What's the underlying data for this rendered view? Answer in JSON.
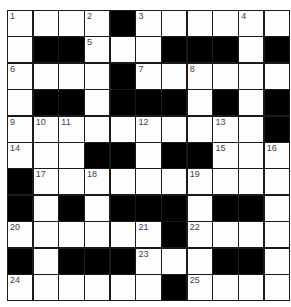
{
  "puzzle": {
    "rows": 11,
    "cols": 11,
    "colors": {
      "block": "#000000",
      "cell": "#fdfdfd",
      "line": "#1a1a1a",
      "number": "#444444"
    },
    "grid": [
      "....#.....X",
      ".##...###.#",
      "....#......",
      ".##.###.#.#",
      "..........#",
      "...##.##...",
      "#..........",
      "#.#.###.##.",
      "......#....",
      "#.###...##.",
      "......#...."
    ],
    "numbers": [
      {
        "r": 0,
        "c": 0,
        "n": "1"
      },
      {
        "r": 0,
        "c": 3,
        "n": "2"
      },
      {
        "r": 0,
        "c": 5,
        "n": "3"
      },
      {
        "r": 0,
        "c": 9,
        "n": "4"
      },
      {
        "r": 1,
        "c": 3,
        "n": "5"
      },
      {
        "r": 2,
        "c": 0,
        "n": "6"
      },
      {
        "r": 2,
        "c": 5,
        "n": "7"
      },
      {
        "r": 2,
        "c": 7,
        "n": "8"
      },
      {
        "r": 4,
        "c": 0,
        "n": "9"
      },
      {
        "r": 4,
        "c": 1,
        "n": "10"
      },
      {
        "r": 4,
        "c": 2,
        "n": "11"
      },
      {
        "r": 4,
        "c": 5,
        "n": "12"
      },
      {
        "r": 4,
        "c": 8,
        "n": "13"
      },
      {
        "r": 5,
        "c": 0,
        "n": "14"
      },
      {
        "r": 5,
        "c": 8,
        "n": "15"
      },
      {
        "r": 5,
        "c": 10,
        "n": "16"
      },
      {
        "r": 6,
        "c": 1,
        "n": "17"
      },
      {
        "r": 6,
        "c": 3,
        "n": "18"
      },
      {
        "r": 6,
        "c": 7,
        "n": "19"
      },
      {
        "r": 8,
        "c": 0,
        "n": "20"
      },
      {
        "r": 8,
        "c": 5,
        "n": "21"
      },
      {
        "r": 8,
        "c": 7,
        "n": "22"
      },
      {
        "r": 9,
        "c": 5,
        "n": "23"
      },
      {
        "r": 10,
        "c": 0,
        "n": "24"
      },
      {
        "r": 10,
        "c": 7,
        "n": "25"
      }
    ]
  }
}
